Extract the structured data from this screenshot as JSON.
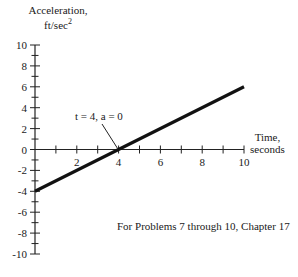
{
  "chart_data": {
    "type": "line",
    "title": "",
    "xlabel": "Time, seconds",
    "ylabel": "Acceleration, ft/sec^2",
    "xlim": [
      0,
      10
    ],
    "ylim": [
      -10,
      10
    ],
    "x_ticks": [
      2,
      4,
      6,
      8,
      10
    ],
    "x_minor_step": 1,
    "y_ticks": [
      10,
      8,
      6,
      4,
      2,
      0,
      -2,
      -4,
      -6,
      -8,
      -10
    ],
    "y_minor_step": 1,
    "grid": false,
    "series": [
      {
        "name": "acceleration",
        "x": [
          0,
          10
        ],
        "y": [
          -4,
          6
        ]
      }
    ],
    "annotations": [
      {
        "text": "t = 4, a = 0",
        "x": 4,
        "y": 0
      }
    ],
    "note": "For Problems 7 through 10, Chapter 17"
  },
  "labels": {
    "ylabel_line1": "Acceleration,",
    "ylabel_line2": "ft/sec",
    "ylabel_sup": "2",
    "xlabel_line1": "Time,",
    "xlabel_line2": "seconds",
    "annotation": "t = 4, a = 0",
    "note": "For Problems 7 through 10, Chapter 17"
  },
  "colors": {
    "line": "#111111",
    "axis": "#222222",
    "text": "#1a1a1a"
  }
}
